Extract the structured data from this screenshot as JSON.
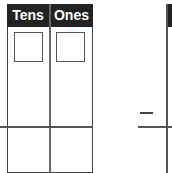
{
  "left_chart": {
    "columns": [
      {
        "label": "Tens"
      },
      {
        "label": "Ones"
      }
    ],
    "answer_boxes": [
      "",
      ""
    ]
  },
  "right_chart": {
    "operator_symbol": "−",
    "columns": [
      {
        "label": ""
      }
    ]
  },
  "colors": {
    "header_bg": "#222222",
    "header_text": "#ffffff",
    "lines": "#555555"
  }
}
